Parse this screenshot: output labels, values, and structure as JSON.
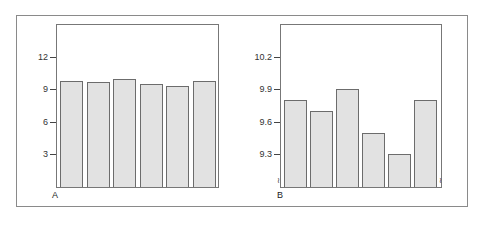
{
  "chart_data": [
    {
      "type": "bar",
      "panel_label": "A",
      "title": "",
      "xlabel": "",
      "ylabel": "",
      "categories": [
        "1",
        "2",
        "3",
        "4",
        "5",
        "6"
      ],
      "values": [
        9.8,
        9.7,
        9.9,
        9.5,
        9.3,
        9.8
      ],
      "ylim": [
        0,
        15
      ],
      "yticks": [
        3,
        6,
        9,
        12
      ],
      "ytick_labels": [
        "3",
        "6",
        "9",
        "12"
      ],
      "grid": false,
      "legend": null,
      "colors": {
        "bar_fill": "#e2e2e2",
        "bar_edge": "#6c6c6c"
      }
    },
    {
      "type": "bar",
      "panel_label": "B",
      "title": "",
      "xlabel": "",
      "ylabel": "",
      "categories": [
        "1",
        "2",
        "3",
        "4",
        "5",
        "6"
      ],
      "values": [
        9.8,
        9.7,
        9.9,
        9.5,
        9.3,
        9.8
      ],
      "ylim": [
        9.0,
        10.5
      ],
      "yticks": [
        9.3,
        9.6,
        9.9,
        10.2
      ],
      "ytick_labels": [
        "9.3",
        "9.6",
        "9.9",
        "10.2"
      ],
      "axis_break": true,
      "grid": false,
      "legend": null,
      "colors": {
        "bar_fill": "#e2e2e2",
        "bar_edge": "#6c6c6c"
      }
    }
  ],
  "labels": {
    "panel_a": "A",
    "panel_b": "B",
    "break_mark": "≀"
  }
}
